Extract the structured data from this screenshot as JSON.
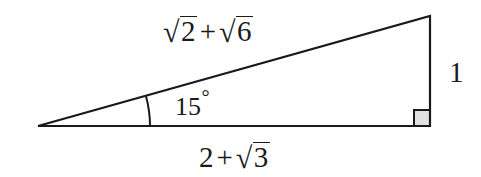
{
  "figure": {
    "type": "geometry-diagram",
    "shape": "right-triangle",
    "background_color": "#ffffff",
    "stroke_color": "#1a1a1a",
    "text_color": "#1a1a1a",
    "right_angle_fill": "#e2e2e2",
    "width": 481,
    "height": 177
  },
  "geometry": {
    "vertices": {
      "left": {
        "x": 38,
        "y": 126
      },
      "top_right": {
        "x": 430,
        "y": 16
      },
      "bottom_right": {
        "x": 430,
        "y": 126
      }
    },
    "angle_arc": {
      "center_x": 38,
      "center_y": 126,
      "radius": 112,
      "from_degrees": 0,
      "to_degrees": 15
    },
    "right_angle_marker": {
      "x": 414,
      "y": 110,
      "size": 16
    }
  },
  "labels": {
    "hypotenuse": {
      "name": "hypotenuse-label",
      "text": "√2 + √6",
      "term1_radicand": "2",
      "operator": "+",
      "term2_radicand": "6"
    },
    "base": {
      "name": "base-label",
      "text": "2 + √3",
      "term1": "2",
      "operator": "+",
      "term2_radicand": "3"
    },
    "vertical_leg": {
      "name": "vertical-leg-label",
      "text": "1"
    },
    "angle": {
      "name": "angle-label",
      "value": "15",
      "unit": "°",
      "text": "15°"
    }
  }
}
